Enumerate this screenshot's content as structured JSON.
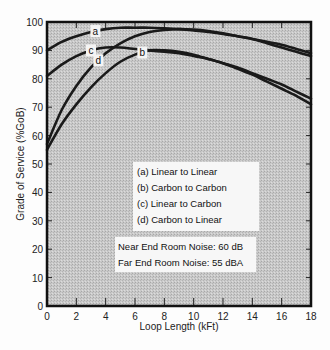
{
  "chart_data": {
    "type": "line",
    "title": "",
    "xlabel": "Loop Length (kFt)",
    "ylabel": "Grade of Service (%GoB)",
    "xlim": [
      0,
      18
    ],
    "ylim": [
      0,
      100
    ],
    "x_ticks": [
      0,
      2,
      4,
      6,
      8,
      10,
      12,
      14,
      16,
      18
    ],
    "y_ticks": [
      0,
      10,
      20,
      30,
      40,
      50,
      60,
      70,
      80,
      90,
      100
    ],
    "grid": false,
    "background": "stippled gray",
    "x": [
      0,
      1,
      2,
      3,
      4,
      5,
      6,
      7,
      8,
      9,
      10,
      11,
      12,
      13,
      14,
      15,
      16,
      17,
      18
    ],
    "series": [
      {
        "name": "(a) Linear to Linear",
        "label": "a",
        "values": [
          90,
          93,
          95,
          96.5,
          97.5,
          98,
          98,
          98,
          97.8,
          97.5,
          97,
          96.5,
          95.8,
          95,
          94,
          93,
          92,
          90.5,
          89
        ]
      },
      {
        "name": "(b) Carbon to Carbon",
        "label": "b",
        "values": [
          55,
          64,
          71,
          77,
          82,
          86,
          88.5,
          90,
          90,
          89.5,
          88.5,
          87,
          85.5,
          83.5,
          81.5,
          79,
          76.5,
          74,
          71
        ]
      },
      {
        "name": "(c) Linear to Carbon",
        "label": "c",
        "values": [
          81,
          85,
          88,
          90,
          91,
          91,
          90.5,
          90,
          89.5,
          89,
          88,
          87,
          85.5,
          84,
          82,
          80,
          78,
          75.5,
          73
        ]
      },
      {
        "name": "(d) Carbon to Linear",
        "label": "d",
        "values": [
          57,
          69,
          77.5,
          84,
          89,
          92.5,
          95,
          96.5,
          97.2,
          97.5,
          97.3,
          96.8,
          96,
          95,
          94,
          92.5,
          91,
          89.5,
          88
        ]
      }
    ],
    "legend": [
      "(a) Linear to Linear",
      "(b) Carbon to Carbon",
      "(c) Linear to Carbon",
      "(d) Carbon to Linear"
    ],
    "legend_position": "center-inside",
    "annotations": [
      "Near End Room Noise: 60 dB",
      "Far End Room Noise: 55 dBA"
    ]
  },
  "legend": {
    "items": [
      "(a) Linear to Linear",
      "(b) Carbon to Carbon",
      "(c) Linear to Carbon",
      "(d) Carbon to Linear"
    ]
  },
  "notes": {
    "line1": "Near End Room Noise: 60 dB",
    "line2": "Far End Room Noise: 55 dBA"
  },
  "axes": {
    "xlabel": "Loop Length (kFt)",
    "ylabel": "Grade of Service (%GoB)"
  }
}
